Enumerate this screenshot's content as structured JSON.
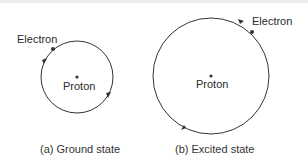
{
  "panels": [
    {
      "id": "ground",
      "caption": "(a) Ground state",
      "electron_label": "Electron",
      "proton_label": "Proton"
    },
    {
      "id": "excited",
      "caption": "(b) Excited state",
      "electron_label": "Electron",
      "proton_label": "Proton"
    }
  ]
}
